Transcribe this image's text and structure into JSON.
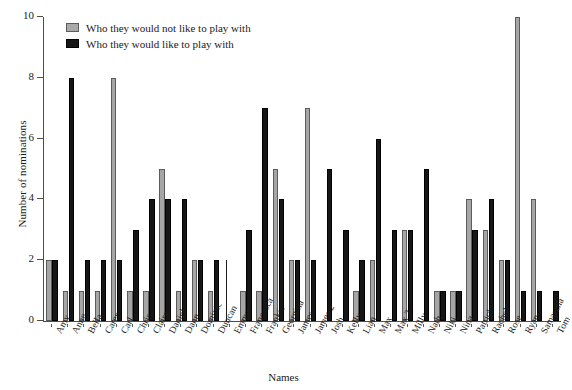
{
  "chart_data": {
    "type": "bar",
    "title": "",
    "xlabel": "Names",
    "ylabel": "Number of nominations",
    "ylim": [
      0,
      10
    ],
    "yticks": [
      0,
      2,
      4,
      6,
      8,
      10
    ],
    "grid": false,
    "legend_position": "top-left",
    "categories": [
      "Amy",
      "Anne",
      "Bella",
      "Caren",
      "Carl",
      "Chris",
      "Claire",
      "Daniel",
      "Dann",
      "Dominic",
      "Duncan",
      "Emma",
      "Francesca",
      "Frankie",
      "Georgina",
      "James",
      "James 2",
      "Josh",
      "Kelly",
      "Lian",
      "Max",
      "Max 2",
      "Milly",
      "Nath",
      "Niki",
      "Nina",
      "Patrick",
      "Rachel",
      "Rose",
      "Ryan",
      "Samantha",
      "Tom"
    ],
    "series": [
      {
        "name": "Who they would not like to play with",
        "color": "#a6a6a6",
        "values": [
          2,
          1,
          1,
          1,
          8,
          1,
          1,
          5,
          1,
          2,
          1,
          2,
          1,
          1,
          5,
          2,
          7,
          0,
          0,
          1,
          2,
          0,
          3,
          0,
          1,
          1,
          4,
          3,
          2,
          10,
          4,
          0
        ]
      },
      {
        "name": "Who they would like to play with",
        "color": "#161616",
        "values": [
          2,
          8,
          2,
          2,
          2,
          3,
          4,
          4,
          4,
          2,
          2,
          0,
          3,
          7,
          4,
          2,
          2,
          5,
          3,
          2,
          6,
          3,
          3,
          5,
          1,
          1,
          3,
          4,
          2,
          1,
          1,
          1
        ]
      }
    ]
  },
  "legend": {
    "items": [
      {
        "label": "Who they would not like to play with",
        "swatch": "gray"
      },
      {
        "label": "Who they would like to play with",
        "swatch": "black"
      }
    ]
  }
}
